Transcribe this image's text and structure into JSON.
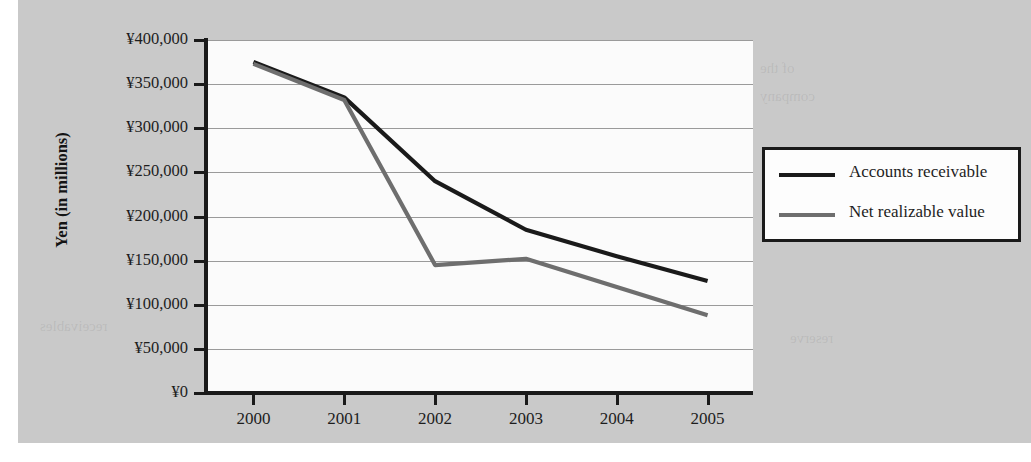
{
  "chart_data": {
    "type": "line",
    "title": "",
    "xlabel": "",
    "ylabel": "Yen (in millions)",
    "x": [
      "2000",
      "2001",
      "2002",
      "2003",
      "2004",
      "2005"
    ],
    "categories": [
      "2000",
      "2001",
      "2002",
      "2003",
      "2004",
      "2005"
    ],
    "series": [
      {
        "name": "Accounts receivable",
        "color": "#1a1a1a",
        "values": [
          375000,
          335000,
          240000,
          185000,
          155000,
          127000
        ]
      },
      {
        "name": "Net realizable value",
        "color": "#6e6e6e",
        "values": [
          373000,
          332000,
          145000,
          152000,
          120000,
          88000
        ]
      }
    ],
    "ylim": [
      0,
      400000
    ],
    "ytick_values": [
      0,
      50000,
      100000,
      150000,
      200000,
      250000,
      300000,
      350000,
      400000
    ],
    "ytick_labels": [
      "¥0",
      "¥50,000",
      "¥100,000",
      "¥150,000",
      "¥200,000",
      "¥250,000",
      "¥300,000",
      "¥350,000",
      "¥400,000"
    ],
    "grid": true,
    "legend_position": "right"
  },
  "legend": {
    "entries": [
      {
        "label": "Accounts receivable",
        "color": "#1a1a1a"
      },
      {
        "label": "Net realizable value",
        "color": "#6e6e6e"
      }
    ]
  },
  "background_bleed": {
    "heading": "KEY EXHIBIT ACCOUNTS",
    "line1": "the amounts that are shown on",
    "line2": "the sale. In this section, we discuss these accounts",
    "line3": "doubtful accounts and allowances",
    "line4": "receivables",
    "right1": "of the",
    "right2": "company",
    "right3": "reserve"
  },
  "colors": {
    "page_background": "#ffffff",
    "scan_background": "#c9c9c9",
    "plot_background": "#fbfbfb",
    "axis": "#1a1a1a",
    "gridline": "#9a9a9a",
    "series_accounts_receivable": "#1a1a1a",
    "series_net_realizable_value": "#6e6e6e"
  }
}
